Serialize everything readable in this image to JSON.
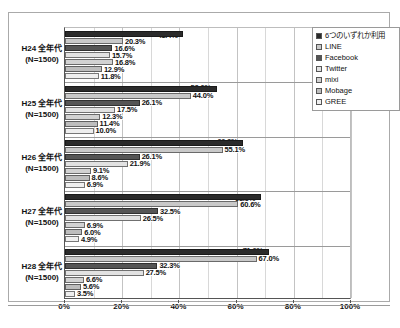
{
  "chart_data": {
    "type": "bar",
    "orientation": "horizontal",
    "title": "",
    "subtitle": "",
    "xlabel": "",
    "ylabel": "",
    "xlim": [
      0,
      100
    ],
    "xticks": [
      "0%",
      "20%",
      "40%",
      "60%",
      "80%",
      "100%"
    ],
    "xtick_values": [
      0,
      20,
      40,
      60,
      80,
      100
    ],
    "grid": true,
    "grid_axis": "x",
    "legend_position": "top-right",
    "value_suffix": "%",
    "categories": [
      "H24 全年代\n(N=1500)",
      "H25 全年代\n(N=1500)",
      "H26 全年代\n(N=1500)",
      "H27 全年代\n(N=1500)",
      "H28 全年代\n(N=1500)"
    ],
    "series": [
      {
        "name": "6つのいずれか利用",
        "color": "#2b2b2b",
        "values": [
          41.4,
          53.0,
          62.3,
          68.5,
          71.2
        ]
      },
      {
        "name": "LINE",
        "color": "#c9c9c9",
        "values": [
          20.3,
          44.0,
          55.1,
          60.6,
          67.0
        ]
      },
      {
        "name": "Facebook",
        "color": "#555555",
        "values": [
          16.6,
          26.1,
          26.1,
          32.5,
          32.3
        ]
      },
      {
        "name": "Twitter",
        "color": "#e2e2e2",
        "values": [
          15.7,
          17.5,
          21.9,
          26.5,
          27.5
        ]
      },
      {
        "name": "mixi",
        "color": "#d2d2d2",
        "values": [
          16.8,
          12.3,
          9.1,
          6.9,
          6.6
        ]
      },
      {
        "name": "Mobage",
        "color": "#bdbdbd",
        "values": [
          12.9,
          11.4,
          8.6,
          6.0,
          5.6
        ]
      },
      {
        "name": "GREE",
        "color": "#efefef",
        "values": [
          11.8,
          10.0,
          6.9,
          4.9,
          3.5
        ]
      }
    ]
  },
  "groups": [
    {
      "line1": "H24 全年代",
      "line2": "(N=1500)",
      "labels": [
        "41.4%",
        "20.3%",
        "16.6%",
        "15.7%",
        "16.8%",
        "12.9%",
        "11.8%"
      ]
    },
    {
      "line1": "H25 全年代",
      "line2": "(N=1500)",
      "labels": [
        "53.0%",
        "44.0%",
        "26.1%",
        "17.5%",
        "12.3%",
        "11.4%",
        "10.0%"
      ]
    },
    {
      "line1": "H26 全年代",
      "line2": "(N=1500)",
      "labels": [
        "62.3%",
        "55.1%",
        "26.1%",
        "21.9%",
        "9.1%",
        "8.6%",
        "6.9%"
      ]
    },
    {
      "line1": "H27 全年代",
      "line2": "(N=1500)",
      "labels": [
        "68.5%",
        "60.6%",
        "32.5%",
        "26.5%",
        "6.9%",
        "6.0%",
        "4.9%"
      ]
    },
    {
      "line1": "H28 全年代",
      "line2": "(N=1500)",
      "labels": [
        "71.2%",
        "67.0%",
        "32.3%",
        "27.5%",
        "6.6%",
        "5.6%",
        "3.5%"
      ]
    }
  ],
  "legend": {
    "items": [
      {
        "label": "6つのいずれか利用",
        "color": "#2b2b2b"
      },
      {
        "label": "LINE",
        "color": "#c9c9c9"
      },
      {
        "label": "Facebook",
        "color": "#555555"
      },
      {
        "label": "Twitter",
        "color": "#e2e2e2"
      },
      {
        "label": "mixi",
        "color": "#d2d2d2"
      },
      {
        "label": "Mobage",
        "color": "#bdbdbd"
      },
      {
        "label": "GREE",
        "color": "#efefef"
      }
    ]
  },
  "footer": {
    "caption": ""
  }
}
